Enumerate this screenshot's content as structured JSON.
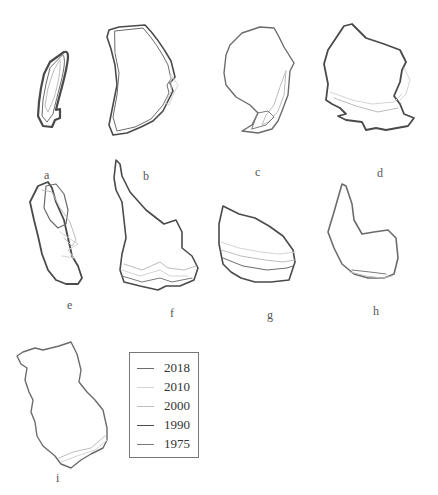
{
  "figure": {
    "panels": [
      {
        "id": "a",
        "label": "a"
      },
      {
        "id": "b",
        "label": "b"
      },
      {
        "id": "c",
        "label": "c"
      },
      {
        "id": "d",
        "label": "d"
      },
      {
        "id": "e",
        "label": "e"
      },
      {
        "id": "f",
        "label": "f"
      },
      {
        "id": "g",
        "label": "g"
      },
      {
        "id": "h",
        "label": "h"
      },
      {
        "id": "i",
        "label": "i"
      }
    ],
    "legend": {
      "entries": [
        {
          "year": "2018",
          "color": "#6b6b6b"
        },
        {
          "year": "2010",
          "color": "#d4d4d4"
        },
        {
          "year": "2000",
          "color": "#bdbdbd"
        },
        {
          "year": "1990",
          "color": "#4a4a4a"
        },
        {
          "year": "1975",
          "color": "#7a7a7a"
        }
      ]
    }
  }
}
